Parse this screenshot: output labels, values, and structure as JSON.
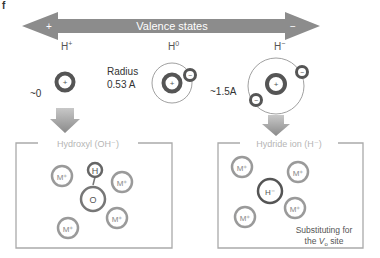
{
  "panel_label": "f",
  "valence_arrow": {
    "label": "Valence states",
    "left_sign": "+",
    "right_sign": "−",
    "color": "#8c8c8c"
  },
  "species": [
    {
      "name": "H+",
      "label_base": "H",
      "label_sup": "+",
      "note": "~0"
    },
    {
      "name": "H0",
      "label_base": "H",
      "label_sup": "0",
      "note_line1": "Radius",
      "note_line2": "0.53 A"
    },
    {
      "name": "H-",
      "label_base": "H",
      "label_sup": "−",
      "note": "~1.5A"
    }
  ],
  "charges": {
    "plus": "+",
    "minus": "−"
  },
  "boxes": [
    {
      "title": "Hydroxyl (OH⁻)",
      "center_atoms": [
        "H",
        "O"
      ],
      "neighbors": [
        "M⁺",
        "M⁺",
        "M⁺",
        "M⁺"
      ]
    },
    {
      "title": "Hydride ion (H⁻)",
      "center_atom": "H⁻",
      "neighbors": [
        "M⁺",
        "M⁺",
        "M⁺",
        "M⁺"
      ],
      "note_line1": "Substituting for",
      "note_line2_prefix": "the ",
      "note_line2_var": "V",
      "note_line2_sub": "o",
      "note_line2_suffix": " site"
    }
  ],
  "colors": {
    "arrow": "#8c8c8c",
    "nucleus": "#555555",
    "electron": "#555555",
    "box_border": "#aaaaaa",
    "box_text": "#b5b5b5",
    "ion_ring": "#9a9a9a",
    "text": "#333333"
  }
}
